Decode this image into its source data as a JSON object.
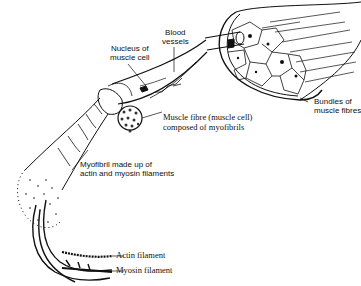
{
  "diagram": {
    "labels": {
      "blood_vessels": [
        "Blood",
        "vessels"
      ],
      "nucleus": [
        "Nucleus of",
        "muscle cell"
      ],
      "muscle_fibre": [
        "Muscle fibre (muscle cell)",
        "composed of myofibrils"
      ],
      "bundles": [
        "Bundles of",
        "muscle fibres"
      ],
      "myofibril": [
        "Myofibril made up of",
        "actin and myosin filaments"
      ],
      "actin": "Actin filament",
      "myosin": "Myosin filament"
    },
    "colors": {
      "ink": "#111111",
      "background": "#ffffff"
    }
  }
}
